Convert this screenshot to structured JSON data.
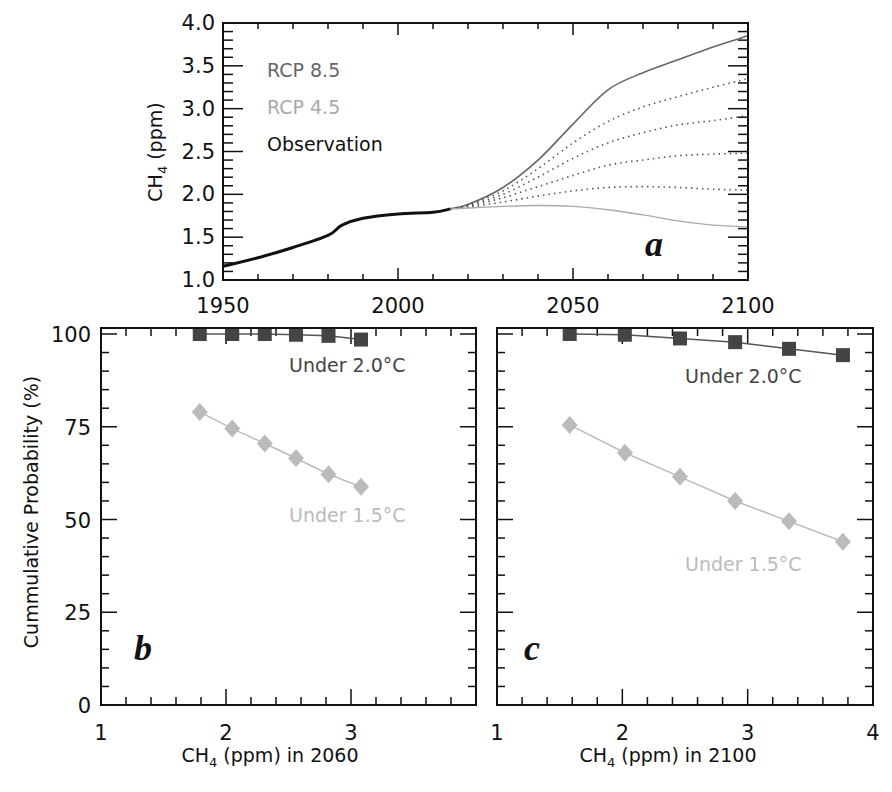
{
  "colors": {
    "axis": "#111111",
    "rcp85": "#666666",
    "rcp45": "#aaaaaa",
    "observation": "#111111",
    "under2": "#444444",
    "under15": "#bbbbbb"
  },
  "chart_data": [
    {
      "panel": "a",
      "type": "line",
      "title": "",
      "xlabel": "",
      "ylabel": "CH4 (ppm)",
      "xlim": [
        1950,
        2100
      ],
      "ylim": [
        1.0,
        4.0
      ],
      "x_ticks": [
        "1950",
        "2000",
        "2050",
        "2100"
      ],
      "y_ticks": [
        "1.0",
        "1.5",
        "2.0",
        "2.5",
        "3.0",
        "3.5",
        "4.0"
      ],
      "legend": [
        {
          "label": "RCP 8.5",
          "color": "#666666"
        },
        {
          "label": "RCP 4.5",
          "color": "#aaaaaa"
        },
        {
          "label": "Observation",
          "color": "#111111"
        }
      ],
      "panel_label": "a",
      "series": [
        {
          "name": "Observation",
          "style": "solid-thick",
          "x": [
            1950,
            1960,
            1970,
            1980,
            1984,
            1990,
            2000,
            2010,
            2015
          ],
          "y": [
            1.16,
            1.26,
            1.38,
            1.52,
            1.64,
            1.72,
            1.77,
            1.79,
            1.83
          ]
        },
        {
          "name": "RCP 8.5",
          "style": "solid",
          "x": [
            2015,
            2020,
            2030,
            2040,
            2050,
            2060,
            2070,
            2080,
            2090,
            2100
          ],
          "y": [
            1.83,
            1.88,
            2.08,
            2.4,
            2.82,
            3.22,
            3.42,
            3.57,
            3.72,
            3.85
          ]
        },
        {
          "name": "Intermediate 1",
          "style": "dotted",
          "x": [
            2015,
            2020,
            2030,
            2040,
            2050,
            2060,
            2070,
            2080,
            2090,
            2100
          ],
          "y": [
            1.83,
            1.88,
            2.04,
            2.3,
            2.6,
            2.85,
            3.02,
            3.14,
            3.25,
            3.35
          ]
        },
        {
          "name": "Intermediate 2",
          "style": "dotted",
          "x": [
            2015,
            2020,
            2030,
            2040,
            2050,
            2060,
            2070,
            2080,
            2090,
            2100
          ],
          "y": [
            1.83,
            1.87,
            2.0,
            2.2,
            2.42,
            2.6,
            2.72,
            2.81,
            2.86,
            2.92
          ]
        },
        {
          "name": "Intermediate 3",
          "style": "dotted",
          "x": [
            2015,
            2020,
            2030,
            2040,
            2050,
            2060,
            2070,
            2080,
            2090,
            2100
          ],
          "y": [
            1.83,
            1.86,
            1.96,
            2.09,
            2.22,
            2.34,
            2.4,
            2.45,
            2.47,
            2.48
          ]
        },
        {
          "name": "Intermediate 4",
          "style": "dotted",
          "x": [
            2015,
            2020,
            2030,
            2040,
            2050,
            2060,
            2070,
            2080,
            2090,
            2100
          ],
          "y": [
            1.83,
            1.85,
            1.91,
            1.98,
            2.04,
            2.08,
            2.09,
            2.08,
            2.06,
            2.05
          ]
        },
        {
          "name": "RCP 4.5",
          "style": "solid",
          "x": [
            2015,
            2020,
            2030,
            2040,
            2050,
            2060,
            2070,
            2080,
            2090,
            2100
          ],
          "y": [
            1.83,
            1.84,
            1.86,
            1.87,
            1.86,
            1.82,
            1.76,
            1.69,
            1.64,
            1.62
          ]
        }
      ]
    },
    {
      "panel": "b",
      "type": "line",
      "xlabel": "CH4 (ppm) in 2060",
      "ylabel": "Cummulative Probability (%)",
      "xlim": [
        1,
        4
      ],
      "ylim": [
        0,
        100
      ],
      "x_ticks": [
        "1",
        "2",
        "3"
      ],
      "y_ticks": [
        "0",
        "25",
        "50",
        "75",
        "100"
      ],
      "panel_label": "b",
      "series": [
        {
          "name": "Under 2.0°C",
          "marker": "square",
          "color": "#444444",
          "x": [
            1.79,
            2.05,
            2.31,
            2.56,
            2.82,
            3.08
          ],
          "y": [
            100,
            100,
            100,
            99.8,
            99.5,
            98.5
          ]
        },
        {
          "name": "Under 1.5°C",
          "marker": "diamond",
          "color": "#bbbbbb",
          "x": [
            1.79,
            2.05,
            2.31,
            2.56,
            2.82,
            3.08
          ],
          "y": [
            79,
            74.5,
            70.5,
            66.5,
            62.2,
            58.8
          ]
        }
      ]
    },
    {
      "panel": "c",
      "type": "line",
      "xlabel": "CH4 (ppm) in 2100",
      "ylabel": "",
      "xlim": [
        1,
        4
      ],
      "ylim": [
        0,
        100
      ],
      "x_ticks": [
        "1",
        "2",
        "3",
        "4"
      ],
      "panel_label": "c",
      "series": [
        {
          "name": "Under 2.0°C",
          "marker": "square",
          "color": "#444444",
          "x": [
            1.58,
            2.02,
            2.46,
            2.9,
            3.33,
            3.76
          ],
          "y": [
            100,
            99.8,
            98.8,
            97.8,
            96,
            94.3
          ]
        },
        {
          "name": "Under 1.5°C",
          "marker": "diamond",
          "color": "#bbbbbb",
          "x": [
            1.58,
            2.02,
            2.46,
            2.9,
            3.33,
            3.76
          ],
          "y": [
            75.5,
            68,
            61.5,
            55,
            49.5,
            44
          ]
        }
      ]
    }
  ],
  "labels": {
    "panel_a": {
      "ylabel_main": "CH",
      "ylabel_sub": "4",
      "ylabel_rest": " (ppm)",
      "legend_rcp85": "RCP 8.5",
      "legend_rcp45": "RCP 4.5",
      "legend_obs": "Observation",
      "letter": "a",
      "x_ticks": [
        "1950",
        "2000",
        "2050",
        "2100"
      ],
      "y_ticks": [
        "1.0",
        "1.5",
        "2.0",
        "2.5",
        "3.0",
        "3.5",
        "4.0"
      ]
    },
    "panel_b": {
      "ylabel": "Cummulative Probability (%)",
      "xlabel_main": "CH",
      "xlabel_sub": "4",
      "xlabel_rest": " (ppm) in 2060",
      "label_under2": "Under 2.0°C",
      "label_under15": "Under 1.5°C",
      "letter": "b",
      "x_ticks": [
        "1",
        "2",
        "3"
      ],
      "y_ticks": [
        "0",
        "25",
        "50",
        "75",
        "100"
      ]
    },
    "panel_c": {
      "xlabel_main": "CH",
      "xlabel_sub": "4",
      "xlabel_rest": " (ppm) in 2100",
      "label_under2": "Under 2.0°C",
      "label_under15": "Under 1.5°C",
      "letter": "c",
      "x_ticks": [
        "1",
        "2",
        "3",
        "4"
      ]
    }
  }
}
